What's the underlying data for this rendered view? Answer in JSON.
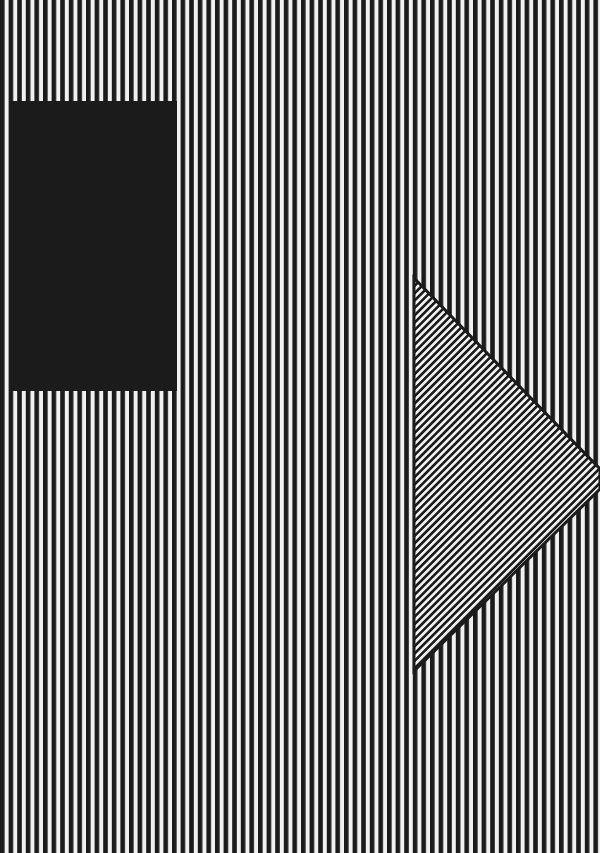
{
  "artwork": {
    "width": 600,
    "height": 853,
    "colors": {
      "black": "#1b1b1b",
      "white": "#f1f1f1"
    },
    "background_stripes": {
      "orientation": "vertical",
      "period": 8.6,
      "black_width": 4.6,
      "offset": 0
    },
    "rectangle": {
      "x": 11,
      "y": 101,
      "width": 166,
      "height": 290,
      "fill": "solid-black"
    },
    "triangle": {
      "points": [
        [
          414,
          278
        ],
        [
          600,
          469
        ],
        [
          600,
          489
        ],
        [
          414,
          671
        ]
      ],
      "border_width": 3,
      "stripe_orientation": "diagonal-down-right",
      "stripe_angle_deg": 45,
      "stripe_period": 5.2,
      "stripe_black_width": 2.6
    }
  }
}
